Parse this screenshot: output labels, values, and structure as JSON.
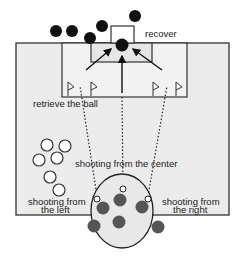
{
  "labels": {
    "recover": "recover",
    "retrieve": "retrieve the ball",
    "center": "shooting from the center",
    "left_line1": "shooting from",
    "left_line2": "the left",
    "right_line1": "shooting from",
    "right_line2": "the right"
  },
  "colors": {
    "field_fill": "#ececec",
    "line": "#333333",
    "dark_ball": "#111111",
    "grey_ball": "#555555",
    "white_ball": "#ffffff",
    "circle_fill": "#e8e8e8"
  },
  "elements": {
    "dark_balls_top": [
      [
        56,
        31
      ],
      [
        72,
        31
      ],
      [
        90,
        38
      ],
      [
        102,
        26
      ],
      [
        135,
        16
      ]
    ],
    "goalkeeper": [
      122,
      45
    ],
    "flags": [
      68,
      91,
      153,
      176
    ],
    "white_balls_left": [
      [
        47,
        145
      ],
      [
        65,
        146
      ],
      [
        39,
        160
      ],
      [
        57,
        158
      ],
      [
        50,
        177
      ],
      [
        59,
        190
      ]
    ],
    "shooter_white_balls": [
      [
        97,
        199
      ],
      [
        123,
        189
      ],
      [
        148,
        199
      ]
    ],
    "grey_balls_circle": [
      [
        103,
        208
      ],
      [
        120,
        200
      ],
      [
        142,
        207
      ],
      [
        94,
        226
      ],
      [
        119,
        222
      ],
      [
        158,
        227
      ]
    ]
  }
}
